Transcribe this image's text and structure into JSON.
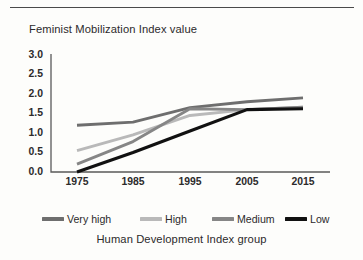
{
  "chart_data": {
    "type": "line",
    "title": "Feminist Mobilization Index value",
    "ylabel": "Feminist Mobilization Index value",
    "xlabel": "Human Development Index group",
    "x": [
      1975,
      1985,
      1995,
      2005,
      2015
    ],
    "xtick_labels": [
      "1975",
      "1985",
      "1995",
      "2005",
      "2015"
    ],
    "ytick_labels": [
      "3.0",
      "2.5",
      "2.0",
      "1.5",
      "1.0",
      "0.5",
      "0.0"
    ],
    "ylim": [
      0.0,
      3.0
    ],
    "xlim": [
      1970,
      2020
    ],
    "grid": false,
    "legend_position": "bottom",
    "series": [
      {
        "name": "Very high",
        "color": "#6e6e6e",
        "values": [
          1.2,
          1.28,
          1.65,
          1.8,
          1.9
        ]
      },
      {
        "name": "High",
        "color": "#b9b9b9",
        "values": [
          0.55,
          0.95,
          1.45,
          1.6,
          1.66
        ]
      },
      {
        "name": "Medium",
        "color": "#868686",
        "values": [
          0.2,
          0.78,
          1.62,
          1.6,
          1.66
        ]
      },
      {
        "name": "Low",
        "color": "#111111",
        "values": [
          0.0,
          0.5,
          1.05,
          1.6,
          1.62
        ]
      }
    ]
  },
  "axes": {
    "y_title": "Feminist Mobilization Index value",
    "x_title": "Human Development Index group",
    "yticks": [
      "3.0",
      "2.5",
      "2.0",
      "1.5",
      "1.0",
      "0.5",
      "0.0"
    ],
    "xticks": [
      "1975",
      "1985",
      "1995",
      "2005",
      "2015"
    ]
  },
  "legend": {
    "items": [
      {
        "label": "Very high",
        "color": "#6e6e6e"
      },
      {
        "label": "High",
        "color": "#b9b9b9"
      },
      {
        "label": "Medium",
        "color": "#868686"
      },
      {
        "label": "Low",
        "color": "#111111"
      }
    ]
  }
}
